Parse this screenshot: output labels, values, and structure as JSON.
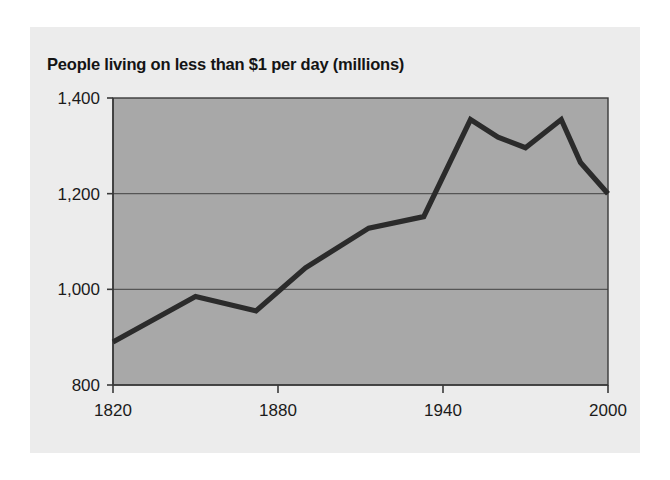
{
  "chart_data": {
    "type": "line",
    "title": "People living on less than $1 per day (millions)",
    "xlabel": "",
    "ylabel": "",
    "xlim": [
      1820,
      2000
    ],
    "ylim": [
      800,
      1400
    ],
    "grid": true,
    "legend": "none",
    "xticks": [
      "1820",
      "1880",
      "1940",
      "2000"
    ],
    "xtick_values": [
      1820,
      1880,
      1940,
      2000
    ],
    "yticks": [
      "800",
      "1,000",
      "1,200",
      "1,400"
    ],
    "ytick_values": [
      800,
      1000,
      1200,
      1400
    ],
    "series": [
      {
        "name": "People living on less than $1 per day (millions)",
        "color": "#2b2b2b",
        "x": [
          1820,
          1850,
          1872,
          1890,
          1913,
          1933,
          1950,
          1960,
          1970,
          1983,
          1990,
          2000
        ],
        "values": [
          890,
          985,
          955,
          1045,
          1128,
          1152,
          1355,
          1318,
          1296,
          1355,
          1265,
          1200
        ]
      }
    ]
  },
  "figure": {
    "plot_bg": "#a8a8a8",
    "card_bg": "#ececec",
    "axis_color": "#3a3a3a",
    "grid_color": "#555555",
    "line_color": "#2b2b2b"
  }
}
